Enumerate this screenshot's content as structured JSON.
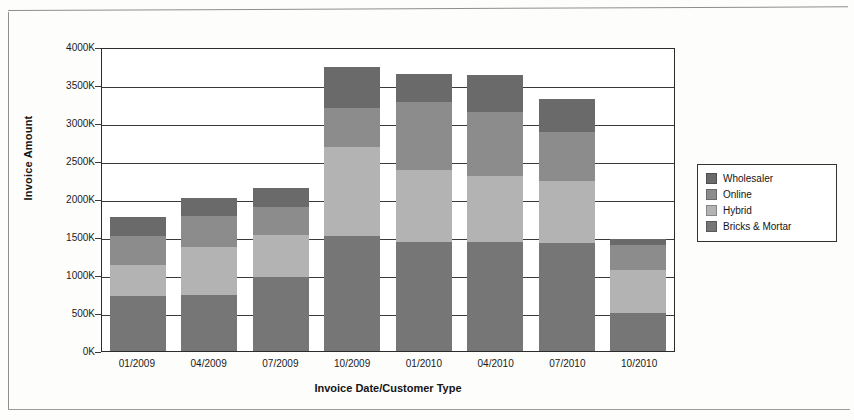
{
  "chart_data": {
    "type": "bar",
    "subtype": "stacked-bar",
    "title": "",
    "xlabel": "Invoice Date/Customer Type",
    "ylabel": "Invoice Amount",
    "categories": [
      "01/2009",
      "04/2009",
      "07/2009",
      "10/2009",
      "01/2010",
      "04/2010",
      "07/2010",
      "10/2010"
    ],
    "ylim": [
      0,
      4000
    ],
    "ytick_labels": [
      "0K",
      "500K",
      "1000K",
      "1500K",
      "2000K",
      "2500K",
      "3000K",
      "3500K",
      "4000K"
    ],
    "ytick_values": [
      0,
      500,
      1000,
      1500,
      2000,
      2500,
      3000,
      3500,
      4000
    ],
    "unit": "K",
    "grid": true,
    "legend_position": "right",
    "stack_order_bottom_to_top": [
      "Bricks & Mortar",
      "Hybrid",
      "Online",
      "Wholesaler"
    ],
    "series": [
      {
        "name": "Wholesaler",
        "color": "#6a6a6a",
        "values": [
          240,
          240,
          240,
          540,
          370,
          490,
          430,
          80
        ]
      },
      {
        "name": "Online",
        "color": "#8c8c8c",
        "values": [
          390,
          410,
          370,
          520,
          900,
          840,
          640,
          320
        ]
      },
      {
        "name": "Hybrid",
        "color": "#b3b3b3",
        "values": [
          410,
          630,
          550,
          1170,
          950,
          870,
          820,
          570
        ]
      },
      {
        "name": "Bricks & Mortar",
        "color": "#767676",
        "values": [
          720,
          740,
          980,
          1510,
          1430,
          1430,
          1420,
          500
        ]
      }
    ],
    "totals": [
      1760,
      2020,
      2140,
      3740,
      3650,
      3630,
      3310,
      1470
    ]
  },
  "legend": {
    "entries": [
      {
        "label": "Wholesaler",
        "color": "#6a6a6a"
      },
      {
        "label": "Online",
        "color": "#8c8c8c"
      },
      {
        "label": "Hybrid",
        "color": "#b3b3b3"
      },
      {
        "label": "Bricks & Mortar",
        "color": "#767676"
      }
    ]
  }
}
